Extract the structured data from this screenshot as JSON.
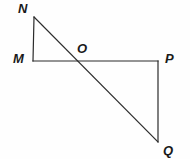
{
  "figure": {
    "stroke_color": "#2b2b2b",
    "background_color": "#fefefe",
    "label_color": "#1a1a1a",
    "stroke_width": 1.2,
    "width": 190,
    "height": 159,
    "points": {
      "N": {
        "label": "N",
        "x": 34,
        "y": 17
      },
      "M": {
        "label": "M",
        "x": 33,
        "y": 61
      },
      "O": {
        "label": "O",
        "x": 73,
        "y": 61
      },
      "P": {
        "label": "P",
        "x": 158,
        "y": 61
      },
      "Q": {
        "label": "Q",
        "x": 158,
        "y": 142
      }
    },
    "segments": [
      {
        "name": "segment-NM",
        "from": "N",
        "to": "M"
      },
      {
        "name": "segment-MP",
        "from": "M",
        "to": "P"
      },
      {
        "name": "segment-PQ",
        "from": "P",
        "to": "Q"
      },
      {
        "name": "segment-NQ",
        "from": "N",
        "to": "Q"
      }
    ],
    "path_data": {
      "nm": "M 34 17 L 33 61",
      "mp": "M 33 61 L 158 61",
      "pq": "M 158 61 L 158 142",
      "nq": "M 34 17 L 158 142"
    }
  }
}
